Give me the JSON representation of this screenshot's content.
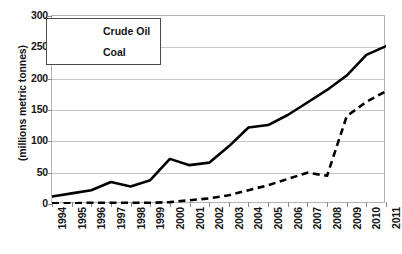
{
  "chart_data": {
    "type": "line",
    "title": "",
    "xlabel": "",
    "ylabel": "(millions metric tonnes)",
    "ylim": [
      0,
      300
    ],
    "ytick_step": 50,
    "yticks": [
      0,
      50,
      100,
      150,
      200,
      250,
      300
    ],
    "grid": true,
    "legend_position": "top-left",
    "categories": [
      "1994",
      "1995",
      "1996",
      "1997",
      "1998",
      "1999",
      "2000",
      "2001",
      "2002",
      "2003",
      "2004",
      "2005",
      "2006",
      "2007",
      "2008",
      "2009",
      "2010",
      "2011"
    ],
    "series": [
      {
        "name": "Crude Oil",
        "style": "solid",
        "color": "#000000",
        "values": [
          12,
          17,
          22,
          35,
          28,
          38,
          72,
          62,
          66,
          92,
          122,
          126,
          142,
          162,
          182,
          205,
          238,
          252
        ]
      },
      {
        "name": "Coal",
        "style": "dashed",
        "color": "#000000",
        "values": [
          1,
          1,
          2,
          2,
          2,
          2,
          3,
          6,
          9,
          14,
          22,
          30,
          40,
          50,
          45,
          140,
          163,
          180
        ]
      }
    ]
  },
  "axis": {
    "y_title": "(millions metric tonnes)",
    "y_labels": [
      "300",
      "250",
      "200",
      "150",
      "100",
      "50",
      "0"
    ],
    "x_labels": [
      "1994",
      "1995",
      "1996",
      "1997",
      "1998",
      "1999",
      "2000",
      "2001",
      "2002",
      "2003",
      "2004",
      "2005",
      "2006",
      "2007",
      "2008",
      "2009",
      "2010",
      "2011"
    ]
  },
  "legend": {
    "entries": [
      {
        "label": "Crude Oil",
        "style": "solid"
      },
      {
        "label": "Coal",
        "style": "dashed"
      }
    ]
  },
  "colors": {
    "series": "#000000",
    "gridline": "#c8c8c8",
    "frame": "#b3b3b3",
    "background": "#ffffff",
    "text": "#151515"
  }
}
